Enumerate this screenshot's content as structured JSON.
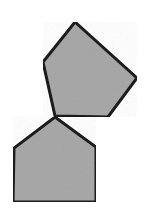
{
  "image": {
    "width": 147,
    "height": 211,
    "background_color": "#ffffff",
    "description": "Two gray pentagons outlined in black, touching at a single shared vertex"
  },
  "style": {
    "fill_color": "#a8a8a8",
    "stroke_color": "#1a1a1a",
    "stroke_width": 3,
    "noise_texture": true,
    "noise_opacity": 0.07
  },
  "shapes": [
    {
      "name": "upper-pentagon",
      "type": "pentagon",
      "sides": 5,
      "orientation": "rotated clockwise about 20 degrees, apex upper-left of center",
      "fill_color": "#a8a8a8",
      "stroke_color": "#1a1a1a",
      "stroke_width": 3,
      "points": "75,22 137,78 108,117 55,116 43,62",
      "vertices": [
        {
          "label": "apex",
          "x": 75,
          "y": 22
        },
        {
          "label": "right",
          "x": 137,
          "y": 78
        },
        {
          "label": "bottom-right",
          "x": 108,
          "y": 117
        },
        {
          "label": "bottom-left",
          "x": 55,
          "y": 116
        },
        {
          "label": "left",
          "x": 43,
          "y": 62
        }
      ],
      "centroid": {
        "x": 84,
        "y": 77
      }
    },
    {
      "name": "lower-pentagon",
      "type": "pentagon",
      "sides": 5,
      "orientation": "upright house shape, apex pointing up",
      "fill_color": "#a8a8a8",
      "stroke_color": "#1a1a1a",
      "stroke_width": 3,
      "points": "55,117 96,147 96,202 13,202 14,148",
      "vertices": [
        {
          "label": "apex",
          "x": 55,
          "y": 117
        },
        {
          "label": "right-shoulder",
          "x": 96,
          "y": 147
        },
        {
          "label": "bottom-right",
          "x": 96,
          "y": 202
        },
        {
          "label": "bottom-left",
          "x": 13,
          "y": 202
        },
        {
          "label": "left-shoulder",
          "x": 14,
          "y": 148
        }
      ],
      "centroid": {
        "x": 55,
        "y": 167
      }
    }
  ],
  "contact_point": {
    "name": "shared-vertex",
    "x": 55,
    "y": 117,
    "description": "the two pentagons meet at one point"
  }
}
